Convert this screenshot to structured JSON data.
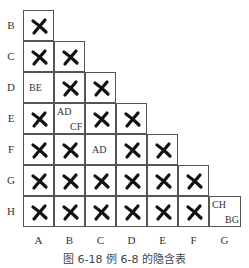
{
  "table": {
    "row_labels": [
      "B",
      "C",
      "D",
      "E",
      "F",
      "G",
      "H"
    ],
    "col_labels": [
      "A",
      "B",
      "C",
      "D",
      "E",
      "F",
      "G"
    ],
    "cells": [
      [
        {
          "mark": "x"
        }
      ],
      [
        {
          "mark": "x"
        },
        {
          "mark": "x"
        }
      ],
      [
        {
          "pairs": [
            "BE"
          ]
        },
        {
          "mark": "x"
        },
        {
          "mark": "x"
        }
      ],
      [
        {
          "mark": "x"
        },
        {
          "pairs": [
            "AD",
            "CF"
          ]
        },
        {
          "mark": "x"
        },
        {
          "mark": "x"
        }
      ],
      [
        {
          "mark": "x"
        },
        {
          "mark": "x"
        },
        {
          "pairs": [
            "AD"
          ]
        },
        {
          "mark": "x"
        },
        {
          "mark": "x"
        }
      ],
      [
        {
          "mark": "x"
        },
        {
          "mark": "x"
        },
        {
          "mark": "x"
        },
        {
          "mark": "x"
        },
        {
          "mark": "x"
        },
        {
          "mark": "x"
        }
      ],
      [
        {
          "mark": "x"
        },
        {
          "mark": "x"
        },
        {
          "mark": "x"
        },
        {
          "mark": "x"
        },
        {
          "mark": "x"
        },
        {
          "mark": "x"
        },
        {
          "pairs": [
            "CH",
            "BG"
          ]
        }
      ]
    ],
    "mark_icon": "cross-mark-icon"
  },
  "text": {
    "row_B": "B",
    "row_C": "C",
    "row_D": "D",
    "row_E": "E",
    "row_F": "F",
    "row_G": "G",
    "row_H": "H",
    "col_A": "A",
    "col_B": "B",
    "col_C": "C",
    "col_D": "D",
    "col_E": "E",
    "col_F": "F",
    "col_G": "G",
    "cell_D_A": "BE",
    "cell_E_B_1": "AD",
    "cell_E_B_2": "CF",
    "cell_F_C": "AD",
    "cell_H_G_1": "CH",
    "cell_H_G_2": "BG"
  },
  "caption": "图 6-18   例 6-8 的隐含表"
}
